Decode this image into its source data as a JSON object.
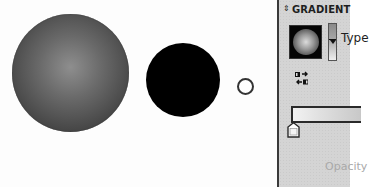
{
  "canvas": {
    "shapes": [
      {
        "name": "gradient-filled-circle",
        "fill": "radial-gradient",
        "fill_colors": [
          "#8e8e8e",
          "#2f2f2f"
        ]
      },
      {
        "name": "black-filled-circle",
        "fill": "#000000"
      },
      {
        "name": "small-outline-circle",
        "stroke": "#333333",
        "fill": "#ffffff"
      }
    ]
  },
  "gradient_panel": {
    "collapse_icon": "up-down-arrows-icon",
    "collapse_glyph": "⇕",
    "title": "GRADIENT",
    "preview_icon": "gradient-preview-swatch",
    "type_label": "Type",
    "reverse_icon": "reverse-gradient-icon",
    "gradient_slider": {
      "start_color": "#f2f2f2",
      "end_color": "#c8c8c8"
    },
    "color_stop_icon": "gradient-color-stop",
    "opacity_label": "Opacity"
  },
  "colors": {
    "panel_bg": "#d4d4d4",
    "panel_border": "#3a3a3a",
    "text_dark": "#1e1e1e",
    "text_disabled": "#a9a9a9"
  }
}
